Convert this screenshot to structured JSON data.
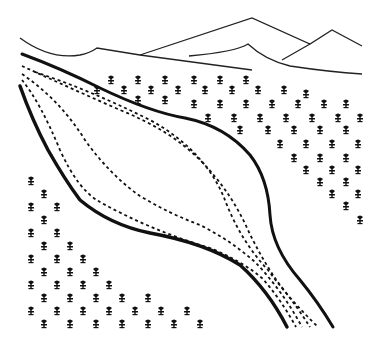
{
  "diagram": {
    "type": "line-art illustration",
    "elements": {
      "mountains": {
        "count": 3,
        "description": "mountain ridge outlines at top"
      },
      "glacier": {
        "description": "glacier outlined by thick solid lines, narrowing toward bottom right"
      },
      "flow_lines": {
        "count": 3,
        "style": "dashed",
        "description": "internal flow lines converging at glacier snout"
      },
      "vegetation": {
        "symbol": "tree-icon",
        "description": "small tree symbols on valley slopes either side of glacier"
      }
    },
    "colors": {
      "line": "#111111",
      "background": "#ffffff"
    }
  }
}
